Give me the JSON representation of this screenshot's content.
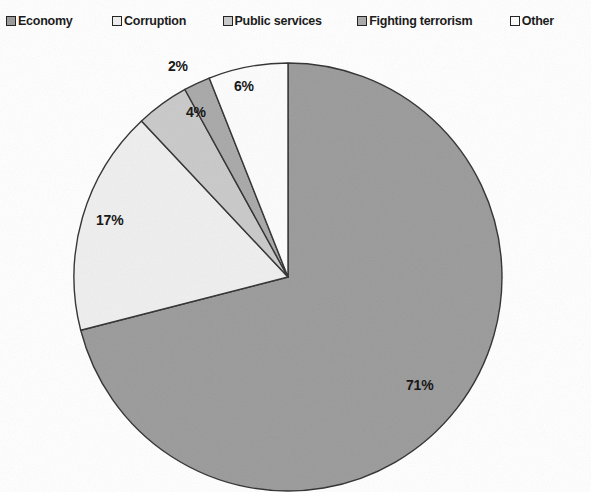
{
  "legend": {
    "position": "top",
    "items": [
      {
        "label": "Economy",
        "color": "#9a9a9a",
        "marker": "filled-square"
      },
      {
        "label": "Corruption",
        "color": "#efefef",
        "marker": "filled-square"
      },
      {
        "label": "Public services",
        "color": "#c9c9c9",
        "marker": "filled-square"
      },
      {
        "label": "Fighting terrorism",
        "color": "#a8a8a8",
        "marker": "filled-square"
      },
      {
        "label": "Other",
        "color": "#fdfdfd",
        "marker": "filled-square"
      }
    ]
  },
  "chart_data": {
    "type": "pie",
    "title": "",
    "categories": [
      "Economy",
      "Corruption",
      "Public services",
      "Fighting terrorism",
      "Other"
    ],
    "values": [
      71,
      17,
      4,
      2,
      6
    ],
    "unit": "%",
    "data_labels": [
      "71%",
      "17%",
      "4%",
      "2%",
      "6%"
    ],
    "colors": [
      "#9a9a9a",
      "#efefef",
      "#c9c9c9",
      "#a8a8a8",
      "#fdfdfd"
    ],
    "slice_border_color": "#303030",
    "start_angle_deg": 0,
    "direction": "clockwise",
    "legend_position": "top",
    "grid": false,
    "total": 100
  },
  "geometry": {
    "center_x": 288,
    "center_y": 277,
    "radius": 214
  },
  "labels": [
    {
      "text": "2%",
      "x": 168,
      "y": 58,
      "series": "Fighting terrorism"
    },
    {
      "text": "6%",
      "x": 234,
      "y": 78,
      "series": "Other"
    },
    {
      "text": "4%",
      "x": 186,
      "y": 104,
      "series": "Public services"
    },
    {
      "text": "17%",
      "x": 96,
      "y": 212,
      "series": "Corruption"
    },
    {
      "text": "71%",
      "x": 406,
      "y": 377,
      "series": "Economy"
    }
  ]
}
